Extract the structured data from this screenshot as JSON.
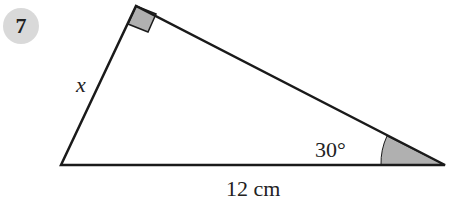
{
  "question_number": "7",
  "labels": {
    "side_x": "x",
    "angle": "30°",
    "base": "12 cm"
  },
  "colors": {
    "badge": "#d9d9d9",
    "shade": "#b0b0b0",
    "line": "#1a1a1a"
  }
}
